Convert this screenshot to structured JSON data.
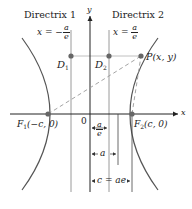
{
  "diagram": {
    "type": "hyperbola-focus-directrix",
    "colors": {
      "curve": "#555555",
      "axes": "#222222",
      "directrix": "#999999",
      "dashed": "#999999",
      "points": "#666666",
      "guide": "#aaaaaa"
    },
    "axes": {
      "x_label": "x",
      "y_label": "y",
      "origin_label": "0"
    },
    "directrices": [
      {
        "title": "Directrix 1",
        "eq_lhs": "x = −",
        "eq_num": "a",
        "eq_den": "e"
      },
      {
        "title": "Directrix 2",
        "eq_lhs": "x = ",
        "eq_num": "a",
        "eq_den": "e"
      }
    ],
    "points": {
      "D1": {
        "label_main": "D",
        "label_sub": "1"
      },
      "D2": {
        "label_main": "D",
        "label_sub": "2"
      },
      "P": {
        "label": "P(x, y)"
      },
      "F1": {
        "label_main": "F",
        "label_sub": "1",
        "label_rest": "(−c, 0)"
      },
      "F2": {
        "label_main": "F",
        "label_sub": "2",
        "label_rest": "(c, 0)"
      }
    },
    "measurements": [
      {
        "name": "a-over-e",
        "num": "a",
        "den": "e"
      },
      {
        "name": "a",
        "label": "a"
      },
      {
        "name": "c",
        "label": "c = ae"
      }
    ]
  }
}
